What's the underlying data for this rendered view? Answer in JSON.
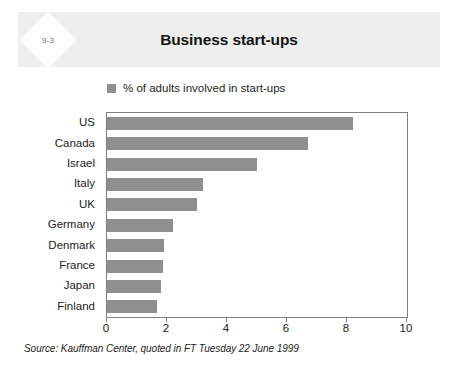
{
  "figure": {
    "number": "9-3",
    "title": "Business start-ups",
    "source_note": "Source: Kauffman Center, quoted in FT Tuesday 22 June 1999"
  },
  "legend": {
    "items": [
      {
        "label": "% of adults involved in start-ups",
        "color": "#8f8f8f"
      }
    ]
  },
  "colors": {
    "bar": "#8f8f8f",
    "header_band": "#eeeeee",
    "axis": "#808080",
    "text": "#1c1c1c"
  },
  "chart_data": {
    "type": "bar",
    "orientation": "horizontal",
    "title": "Business start-ups",
    "xlabel": "",
    "ylabel": "",
    "xlim": [
      0,
      10
    ],
    "xticks": [
      0,
      2,
      4,
      6,
      8,
      10
    ],
    "grid": false,
    "legend_position": "top-left",
    "categories": [
      "US",
      "Canada",
      "Israel",
      "Italy",
      "UK",
      "Germany",
      "Denmark",
      "France",
      "Japan",
      "Finland"
    ],
    "series": [
      {
        "name": "% of adults involved in start-ups",
        "color": "#8f8f8f",
        "values": [
          8.2,
          6.7,
          5.0,
          3.2,
          3.0,
          2.2,
          1.9,
          1.85,
          1.8,
          1.65
        ]
      }
    ],
    "annotations": [
      "Source: Kauffman Center, quoted in FT Tuesday 22 June 1999"
    ]
  }
}
